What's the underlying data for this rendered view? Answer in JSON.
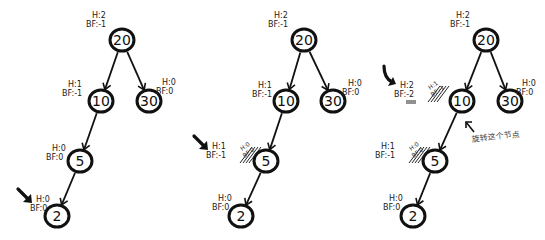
{
  "diagram": {
    "panels": [
      {
        "id": "panel-1",
        "nodes": [
          {
            "key": "20",
            "cx": 122,
            "cy": 40,
            "h": "H:2",
            "bf": "BF:-1",
            "lx": 92,
            "ly": 18
          },
          {
            "key": "10",
            "cx": 101,
            "cy": 101,
            "h": "H:1",
            "bf": "BF:-1",
            "lx": 68,
            "ly": 87
          },
          {
            "key": "30",
            "cx": 149,
            "cy": 101,
            "h": "H:0",
            "bf": "BF:0",
            "lx": 162,
            "ly": 85
          },
          {
            "key": "5",
            "cx": 80,
            "cy": 161,
            "h": "H:0",
            "bf": "BF:0",
            "lx": 52,
            "ly": 151
          },
          {
            "key": "2",
            "cx": 57,
            "cy": 216,
            "h": "H:0",
            "bf": "BF:0",
            "lx": 36,
            "ly": 202
          }
        ],
        "pointer": {
          "x": 22,
          "y": 193,
          "target": "2"
        }
      },
      {
        "id": "panel-2",
        "nodes": [
          {
            "key": "20",
            "cx": 304,
            "cy": 40,
            "h": "H:2",
            "bf": "BF:-1",
            "lx": 274,
            "ly": 18
          },
          {
            "key": "10",
            "cx": 286,
            "cy": 101,
            "h": "H:1",
            "bf": "BF:-1",
            "lx": 258,
            "ly": 88
          },
          {
            "key": "30",
            "cx": 333,
            "cy": 101,
            "h": "H:0",
            "bf": "BF:0",
            "lx": 348,
            "ly": 86
          },
          {
            "key": "5",
            "cx": 266,
            "cy": 161,
            "h": "H:1",
            "bf": "BF:-1",
            "lx": 212,
            "ly": 149,
            "struck": [
              "H:0",
              "BF:0"
            ]
          },
          {
            "key": "2",
            "cx": 241,
            "cy": 216,
            "h": "H:0",
            "bf": "BF:0",
            "lx": 218,
            "ly": 201
          }
        ],
        "pointer": {
          "x": 198,
          "y": 140,
          "target": "5"
        }
      },
      {
        "id": "panel-3",
        "nodes": [
          {
            "key": "20",
            "cx": 486,
            "cy": 40,
            "h": "H:2",
            "bf": "BF:-1",
            "lx": 456,
            "ly": 18
          },
          {
            "key": "10",
            "cx": 462,
            "cy": 101,
            "h": "H:2",
            "bf": "BF:-2",
            "lx": 400,
            "ly": 88,
            "struck": [
              "H:1",
              "BF:-1"
            ]
          },
          {
            "key": "30",
            "cx": 510,
            "cy": 101,
            "h": "H:0",
            "bf": "BF:0",
            "lx": 522,
            "ly": 86
          },
          {
            "key": "5",
            "cx": 435,
            "cy": 161,
            "h": "H:1",
            "bf": "BF:-1",
            "lx": 381,
            "ly": 149,
            "struck": [
              "H:0",
              "BF:0"
            ]
          },
          {
            "key": "2",
            "cx": 413,
            "cy": 216,
            "h": "H:0",
            "bf": "BF:0",
            "lx": 389,
            "ly": 201
          }
        ],
        "pointer": {
          "x": 384,
          "y": 72,
          "target": "10"
        },
        "note": {
          "text": "旋转这个节点",
          "translation": "rotate this node",
          "x": 470,
          "y": 142
        }
      }
    ],
    "edges": [
      [
        "20",
        "10"
      ],
      [
        "20",
        "30"
      ],
      [
        "10",
        "5"
      ],
      [
        "5",
        "2"
      ]
    ]
  }
}
